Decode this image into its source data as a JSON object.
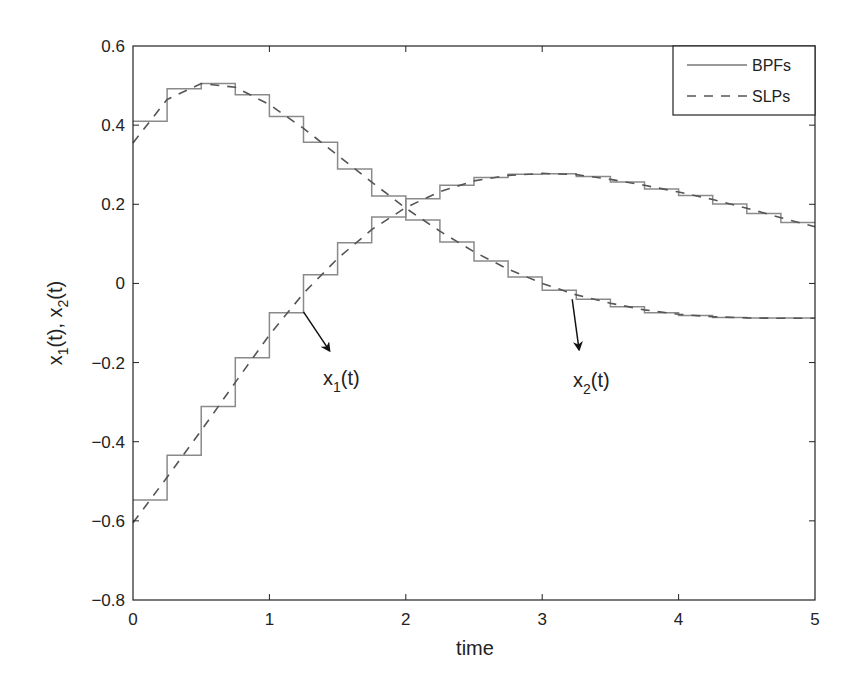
{
  "chart_data": {
    "type": "line",
    "title": "",
    "xlabel": "time",
    "ylabel": "x1(t),  x2(t)",
    "xlim": [
      0,
      5
    ],
    "ylim": [
      -0.8,
      0.6
    ],
    "xticks": [
      0,
      1,
      2,
      3,
      4,
      5
    ],
    "xtick_labels": [
      "0",
      "1",
      "2",
      "3",
      "4",
      "5"
    ],
    "yticks": [
      -0.8,
      -0.6,
      -0.4,
      -0.2,
      0,
      0.2,
      0.4,
      0.6
    ],
    "ytick_labels": [
      "-0.8",
      "-0.6",
      "-0.4",
      "-0.2",
      "0",
      "0.2",
      "0.4",
      "0.6"
    ],
    "grid": false,
    "legend_position": "upper right",
    "step_width": 0.25,
    "series": [
      {
        "name": "BPFs",
        "style": "solid-step",
        "curves": {
          "x1": [
            0.41,
            0.492,
            0.505,
            0.477,
            0.422,
            0.357,
            0.289,
            0.221,
            0.16,
            0.105,
            0.057,
            0.016,
            -0.017,
            -0.04,
            -0.059,
            -0.074,
            -0.081,
            -0.086,
            -0.087,
            -0.087
          ],
          "x2": [
            -0.547,
            -0.434,
            -0.311,
            -0.188,
            -0.074,
            0.022,
            0.103,
            0.168,
            0.214,
            0.248,
            0.268,
            0.276,
            0.277,
            0.27,
            0.256,
            0.239,
            0.222,
            0.201,
            0.177,
            0.154
          ]
        }
      },
      {
        "name": "SLPs",
        "style": "dashed",
        "t": [
          0,
          0.25,
          0.5,
          0.75,
          1,
          1.25,
          1.5,
          1.75,
          2,
          2.25,
          2.5,
          2.75,
          3,
          3.25,
          3.5,
          3.75,
          4,
          4.25,
          4.5,
          4.75,
          5
        ],
        "curves": {
          "x1": [
            0.355,
            0.465,
            0.505,
            0.496,
            0.452,
            0.392,
            0.324,
            0.256,
            0.19,
            0.132,
            0.08,
            0.036,
            0.0,
            -0.029,
            -0.05,
            -0.067,
            -0.078,
            -0.084,
            -0.087,
            -0.088,
            -0.088
          ],
          "x2": [
            -0.605,
            -0.49,
            -0.372,
            -0.25,
            -0.13,
            -0.025,
            0.063,
            0.136,
            0.192,
            0.232,
            0.259,
            0.273,
            0.278,
            0.275,
            0.263,
            0.248,
            0.231,
            0.212,
            0.19,
            0.166,
            0.143
          ]
        }
      }
    ],
    "legend": [
      "BPFs",
      "SLPs"
    ],
    "annotations": [
      {
        "text_main": "x",
        "text_sub": "1",
        "text_tail": "(t)",
        "arrow_from": [
          1.25,
          -0.072
        ],
        "arrow_to": [
          1.44,
          -0.17
        ]
      },
      {
        "text_main": "x",
        "text_sub": "2",
        "text_tail": "(t)",
        "arrow_from": [
          3.22,
          -0.04
        ],
        "arrow_to": [
          3.27,
          -0.167
        ]
      }
    ]
  }
}
